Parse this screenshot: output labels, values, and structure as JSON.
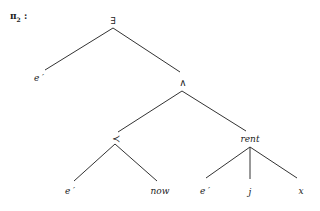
{
  "title": {
    "symbol": "π",
    "subscript": "2",
    "suffix": " :"
  },
  "tree": {
    "nodes": [
      {
        "id": "root",
        "label": "∃",
        "kind": "symbol"
      },
      {
        "id": "e1",
        "label": "e ′",
        "kind": "italic"
      },
      {
        "id": "and",
        "label": "∧",
        "kind": "symbol"
      },
      {
        "id": "prec",
        "label": "≺",
        "kind": "symbol"
      },
      {
        "id": "rent",
        "label": "rent",
        "kind": "italic"
      },
      {
        "id": "e2",
        "label": "e ′",
        "kind": "italic"
      },
      {
        "id": "now",
        "label": "now",
        "kind": "italic"
      },
      {
        "id": "e3",
        "label": "e ′",
        "kind": "italic"
      },
      {
        "id": "j",
        "label": "j",
        "kind": "italic"
      },
      {
        "id": "x",
        "label": "x",
        "kind": "italic"
      }
    ],
    "edges": [
      [
        "root",
        "e1"
      ],
      [
        "root",
        "and"
      ],
      [
        "and",
        "prec"
      ],
      [
        "and",
        "rent"
      ],
      [
        "prec",
        "e2"
      ],
      [
        "prec",
        "now"
      ],
      [
        "rent",
        "e3"
      ],
      [
        "rent",
        "j"
      ],
      [
        "rent",
        "x"
      ]
    ]
  }
}
